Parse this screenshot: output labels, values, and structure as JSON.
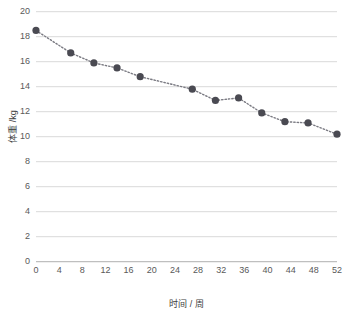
{
  "chart_data": {
    "type": "line",
    "title": "",
    "subtitle": "",
    "xlabel": "时间 / 周",
    "ylabel": "体重 /kg",
    "xlim": [
      0,
      52
    ],
    "ylim": [
      0,
      20
    ],
    "xticks": [
      0,
      4,
      8,
      12,
      16,
      20,
      24,
      28,
      32,
      36,
      40,
      44,
      48,
      52
    ],
    "yticks": [
      0,
      2,
      4,
      6,
      8,
      10,
      12,
      14,
      16,
      18,
      20
    ],
    "grid": "horizontal",
    "legend": "none",
    "series": [
      {
        "name": "体重",
        "marker": "circle",
        "marker_color": "#4a4a52",
        "line_style": "dotted",
        "line_color": "#7a7a82",
        "x": [
          0,
          6,
          10,
          14,
          18,
          27,
          31,
          35,
          39,
          43,
          47,
          52
        ],
        "values": [
          18.5,
          16.7,
          15.9,
          15.5,
          14.8,
          13.8,
          12.9,
          13.1,
          11.9,
          11.2,
          11.1,
          10.2
        ]
      }
    ],
    "colors": {
      "gridline": "#d9d9d9",
      "axis": "#bfbfbf",
      "tick_text": "#595959",
      "axis_label_text": "#404040",
      "background": "#ffffff"
    }
  }
}
